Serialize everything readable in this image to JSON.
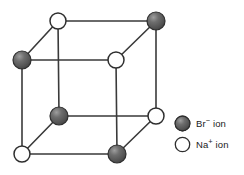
{
  "figure": {
    "background_color": "#ffffff",
    "edge_color": "#3a3a3a",
    "ion_colors": {
      "anion_dark": "#5a5a5a",
      "anion_dark_edge": "#2e2e2e",
      "anion_highlight": "#9a9a9a",
      "cation_white": "#ffffff",
      "cation_white_edge": "#2e2e2e"
    }
  },
  "lattice": {
    "type": "cubic-unit-cell",
    "vertices": [
      {
        "id": "back-top-left",
        "x": 58,
        "y": 21,
        "ion": "cation",
        "label": "Na+ ion",
        "r": 8
      },
      {
        "id": "back-top-right",
        "x": 156,
        "y": 21,
        "ion": "anion",
        "label": "Br- ion",
        "r": 9
      },
      {
        "id": "front-top-left",
        "x": 22,
        "y": 60,
        "ion": "anion",
        "label": "Br- ion",
        "r": 9
      },
      {
        "id": "front-top-right",
        "x": 116,
        "y": 60,
        "ion": "cation",
        "label": "Na+ ion",
        "r": 8
      },
      {
        "id": "back-bottom-left",
        "x": 59,
        "y": 116,
        "ion": "anion",
        "label": "Br- ion",
        "r": 9
      },
      {
        "id": "back-bottom-right",
        "x": 156,
        "y": 116,
        "ion": "cation",
        "label": "Na+ ion",
        "r": 8
      },
      {
        "id": "front-bottom-left",
        "x": 22,
        "y": 154,
        "ion": "cation",
        "label": "Na+ ion",
        "r": 8
      },
      {
        "id": "front-bottom-right",
        "x": 117,
        "y": 154,
        "ion": "anion",
        "label": "Br- ion",
        "r": 9
      }
    ],
    "edges": [
      {
        "from": "back-top-left",
        "to": "back-top-right"
      },
      {
        "from": "back-top-left",
        "to": "back-bottom-left"
      },
      {
        "from": "back-top-right",
        "to": "back-bottom-right"
      },
      {
        "from": "back-bottom-left",
        "to": "back-bottom-right"
      },
      {
        "from": "front-top-left",
        "to": "front-top-right"
      },
      {
        "from": "front-top-left",
        "to": "front-bottom-left"
      },
      {
        "from": "front-top-right",
        "to": "front-bottom-right"
      },
      {
        "from": "front-bottom-left",
        "to": "front-bottom-right"
      },
      {
        "from": "front-top-left",
        "to": "back-top-left"
      },
      {
        "from": "front-top-right",
        "to": "back-top-right"
      },
      {
        "from": "front-bottom-left",
        "to": "back-bottom-left"
      },
      {
        "from": "front-bottom-right",
        "to": "back-bottom-right"
      }
    ]
  },
  "legend": {
    "items": [
      {
        "swatch": "dark-sphere",
        "ion": "anion",
        "symbol": "Br",
        "charge": "−",
        "suffix": " ion"
      },
      {
        "swatch": "white-sphere",
        "ion": "cation",
        "symbol": "Na",
        "charge": "+",
        "suffix": " ion"
      }
    ]
  }
}
